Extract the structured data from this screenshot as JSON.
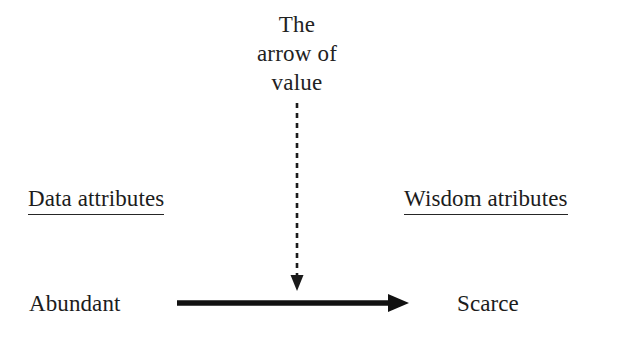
{
  "figure": {
    "background_color": "#ffffff",
    "ink_color": "#1a1a1a",
    "title": {
      "line1": "The",
      "line2": "arrow of",
      "line3": "value"
    },
    "headings": {
      "left": "Data attributes",
      "right": "Wisdom atributes"
    },
    "endpoints": {
      "left": "Abundant",
      "right": "Scarce"
    },
    "arrows": {
      "vertical": {
        "style": "dashed",
        "direction": "down",
        "color": "#1a1a1a"
      },
      "horizontal": {
        "style": "solid",
        "direction": "right",
        "color": "#111111"
      }
    }
  }
}
